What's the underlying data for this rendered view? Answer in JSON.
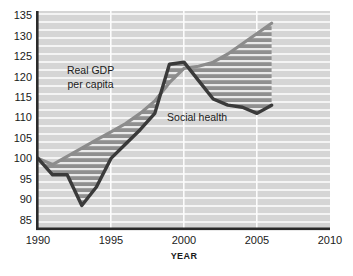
{
  "chart_data": {
    "type": "line",
    "title": "",
    "xlabel": "YEAR",
    "ylabel": "",
    "xlim": [
      1990,
      2010
    ],
    "ylim": [
      83,
      136
    ],
    "grid": true,
    "legend_position": "inline-annotations",
    "xticks": [
      "1990",
      "1995",
      "2000",
      "2005",
      "2010"
    ],
    "xtick_values": [
      1990,
      1995,
      2000,
      2005,
      2010
    ],
    "yticks": [
      "85",
      "90",
      "95",
      "100",
      "105",
      "110",
      "115",
      "120",
      "125",
      "130",
      "135"
    ],
    "ytick_values": [
      85,
      90,
      95,
      100,
      105,
      110,
      115,
      120,
      125,
      130,
      135
    ],
    "x": [
      1990,
      1991,
      1992,
      1993,
      1994,
      1995,
      1996,
      1997,
      1998,
      1999,
      2000,
      2001,
      2002,
      2003,
      2004,
      2005,
      2006
    ],
    "series": [
      {
        "name": "Real GDP per capita",
        "color": "#8c8c8c",
        "values": [
          100,
          98.5,
          100.5,
          102.5,
          104.5,
          106.5,
          108.5,
          111,
          114,
          118.5,
          122,
          122.5,
          123.5,
          125.5,
          128,
          130.5,
          133
        ]
      },
      {
        "name": "Social health",
        "color": "#3a3a3a",
        "values": [
          100,
          96,
          96,
          88.5,
          93,
          100,
          103.5,
          107,
          111,
          123,
          123.5,
          119,
          114.5,
          113,
          112.5,
          111,
          113
        ]
      }
    ],
    "annotations": [
      {
        "text": "Real GDP",
        "x": 1993.6,
        "y": 120.7
      },
      {
        "text": "per capita",
        "x": 1993.6,
        "y": 117.1
      },
      {
        "text": "Social health",
        "x": 2000.9,
        "y": 109.2
      }
    ],
    "fill": {
      "between": [
        "Real GDP per capita",
        "Social health"
      ],
      "color": "#8f8f8f",
      "hatch": "horizontal-white-lines"
    }
  },
  "style": {
    "plot_background": "#d5d5d5",
    "gridline_color": "#f2f2f2",
    "axis_color": "#2b2b2b",
    "vertical_gridline_color": "#fbfbfb"
  }
}
